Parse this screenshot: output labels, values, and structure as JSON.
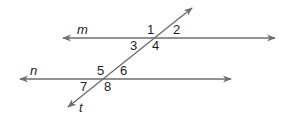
{
  "diagram": {
    "type": "parallel-lines-transversal",
    "stroke_color": "#6e6e6e",
    "text_color": "#1e1e1e",
    "lines": [
      {
        "id": "m",
        "label": "m",
        "x1": 63,
        "y1": 38,
        "x2": 275,
        "y2": 38,
        "arrows": "both",
        "label_x": 77,
        "label_y": 34
      },
      {
        "id": "n",
        "label": "n",
        "x1": 20,
        "y1": 79,
        "x2": 231,
        "y2": 79,
        "arrows": "both",
        "label_x": 30,
        "label_y": 75
      },
      {
        "id": "t",
        "label": "t",
        "x1": 192,
        "y1": 8,
        "x2": 68,
        "y2": 107,
        "arrows": "both",
        "label_x": 79,
        "label_y": 112
      }
    ],
    "angles": [
      {
        "label": "1",
        "x": 147,
        "y": 34
      },
      {
        "label": "2",
        "x": 173,
        "y": 34
      },
      {
        "label": "3",
        "x": 130,
        "y": 50
      },
      {
        "label": "4",
        "x": 152,
        "y": 50
      },
      {
        "label": "5",
        "x": 97,
        "y": 75
      },
      {
        "label": "6",
        "x": 120,
        "y": 75
      },
      {
        "label": "7",
        "x": 80,
        "y": 91
      },
      {
        "label": "8",
        "x": 104,
        "y": 91
      }
    ]
  }
}
